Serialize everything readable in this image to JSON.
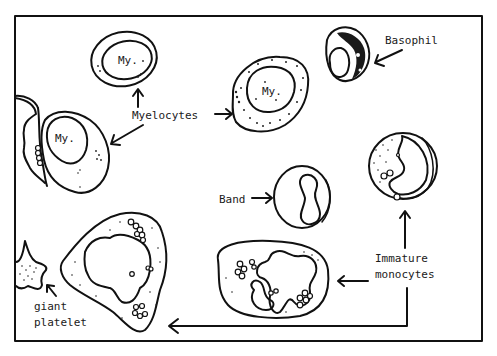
{
  "diagram": {
    "type": "hand-drawn blood cell illustration",
    "labels": {
      "myelocytes": "Myelocytes",
      "basophil": "Basophil",
      "band": "Band",
      "immature_monocytes_line1": "Immature",
      "immature_monocytes_line2": "monocytes",
      "giant_platelet_line1": "giant",
      "giant_platelet_line2": "platelet"
    },
    "cell_annotations": {
      "my_top": "My.",
      "my_right": "My.",
      "my_left": "My."
    },
    "colors": {
      "ink": "#111111",
      "background": "#ffffff"
    }
  }
}
